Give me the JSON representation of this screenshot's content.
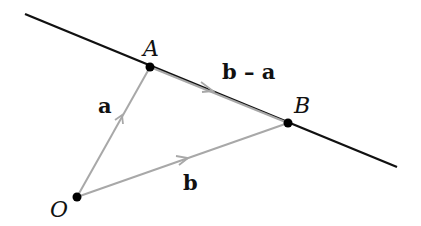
{
  "diagram": {
    "type": "vector-diagram",
    "colors": {
      "line": "#111111",
      "vector": "#a8a8a8",
      "point": "#000000",
      "background": "#ffffff"
    },
    "points": [
      {
        "id": "O",
        "label": "O",
        "x": 77,
        "y": 197
      },
      {
        "id": "A",
        "label": "A",
        "x": 150,
        "y": 67
      },
      {
        "id": "B",
        "label": "B",
        "x": 288,
        "y": 123
      }
    ],
    "line": {
      "label": "",
      "from": [
        25,
        14
      ],
      "to": [
        397,
        167
      ]
    },
    "vectors": [
      {
        "from": "O",
        "to": "A",
        "label": "a"
      },
      {
        "from": "O",
        "to": "B",
        "label": "b"
      },
      {
        "from": "A",
        "to": "B",
        "label": "b – a"
      }
    ]
  },
  "labels": {
    "O": "O",
    "A": "A",
    "B": "B",
    "a": "a",
    "b": "b",
    "b_minus_a": "b – a"
  }
}
